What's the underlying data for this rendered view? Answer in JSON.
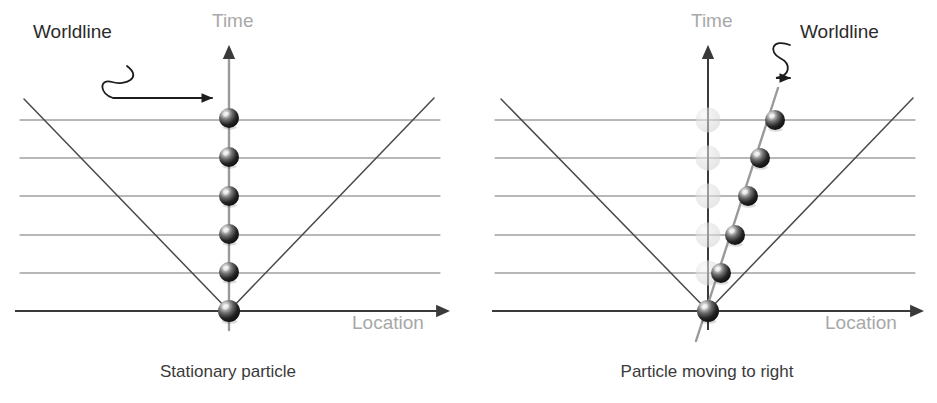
{
  "figure": {
    "width": 937,
    "height": 403,
    "background": "#ffffff"
  },
  "colors": {
    "axis": "#3a3a3a",
    "axis_label_gray": "#a8a8a8",
    "gridline": "#707070",
    "lightcone": "#4a4a4a",
    "worldline_gray": "#9a9a9a",
    "callout_text": "#2b2b2b",
    "caption_text": "#3a3a3a",
    "sphere_dark": "#1c1c1c",
    "sphere_mid": "#6b6b6b",
    "sphere_highlight": "#e8e8e8",
    "ghost_sphere": "#cfcfcf"
  },
  "panels": [
    {
      "id": "stationary",
      "caption": "Stationary particle",
      "caption_x": 228,
      "caption_y": 377,
      "origin": {
        "x": 229,
        "y": 311
      },
      "time_axis": {
        "label": "Time",
        "label_x": 212,
        "label_y": 27,
        "x": 229,
        "y_top": 47,
        "y_bottom": 330
      },
      "location_axis": {
        "label": "Location",
        "label_x": 352,
        "label_y": 329,
        "y": 311,
        "x_left": 15,
        "x_right": 448
      },
      "gridlines": {
        "x_left": 20,
        "x_right": 440,
        "y_values": [
          120,
          158,
          196,
          235,
          273
        ]
      },
      "lightcone": {
        "apex": {
          "x": 229,
          "y": 311
        },
        "left_end": {
          "x": 24,
          "y": 99
        },
        "right_end": {
          "x": 434,
          "y": 98
        }
      },
      "worldline": {
        "kind": "vertical",
        "x_start": 229,
        "y_start": 330,
        "x_end": 229,
        "y_end": 60,
        "color": "#9a9a9a"
      },
      "callout": {
        "label": "Worldline",
        "label_x": 33,
        "label_y": 38,
        "arrow_path": "M 127 66 C 143 78 125 86 112 82 C 99 78 99 94 113 98 L 212 98",
        "arrow_tip": {
          "x": 222,
          "y": 98
        }
      },
      "particles": [
        {
          "x": 229,
          "y": 118,
          "r": 10,
          "ghost": false
        },
        {
          "x": 229,
          "y": 157,
          "r": 10,
          "ghost": false
        },
        {
          "x": 229,
          "y": 196,
          "r": 10,
          "ghost": false
        },
        {
          "x": 229,
          "y": 234,
          "r": 10,
          "ghost": false
        },
        {
          "x": 229,
          "y": 272,
          "r": 10,
          "ghost": false
        },
        {
          "x": 229,
          "y": 311,
          "r": 11,
          "ghost": false
        }
      ]
    },
    {
      "id": "moving-right",
      "caption": "Particle moving to right",
      "caption_x": 707,
      "caption_y": 377,
      "origin": {
        "x": 708,
        "y": 311
      },
      "time_axis": {
        "label": "Time",
        "label_x": 691,
        "label_y": 27,
        "x": 708,
        "y_top": 47,
        "y_bottom": 330
      },
      "location_axis": {
        "label": "Location",
        "label_x": 825,
        "label_y": 329,
        "y": 311,
        "x_left": 492,
        "x_right": 922
      },
      "gridlines": {
        "x_left": 495,
        "x_right": 915,
        "y_values": [
          120,
          158,
          196,
          235,
          273
        ]
      },
      "lightcone": {
        "apex": {
          "x": 708,
          "y": 311
        },
        "left_end": {
          "x": 501,
          "y": 99
        },
        "right_end": {
          "x": 913,
          "y": 98
        }
      },
      "worldline": {
        "kind": "tilted",
        "x_start": 696,
        "y_start": 341,
        "x_end": 778,
        "y_end": 88,
        "color": "#9a9a9a"
      },
      "callout": {
        "label": "Worldline",
        "label_x": 800,
        "label_y": 38,
        "arrow_path": "M 790 45 C 772 38 768 52 780 58 C 792 64 790 76 776 78 L 790 78",
        "arrow_tip": {
          "x": 785,
          "y": 78
        }
      },
      "particles": [
        {
          "x": 775,
          "y": 120,
          "r": 10,
          "ghost": false
        },
        {
          "x": 760,
          "y": 158,
          "r": 10,
          "ghost": false
        },
        {
          "x": 748,
          "y": 196,
          "r": 10,
          "ghost": false
        },
        {
          "x": 735,
          "y": 235,
          "r": 10,
          "ghost": false
        },
        {
          "x": 721,
          "y": 273,
          "r": 10,
          "ghost": false
        },
        {
          "x": 708,
          "y": 311,
          "r": 11,
          "ghost": false
        }
      ],
      "ghost_particles": [
        {
          "x": 708,
          "y": 120,
          "r": 11,
          "ghost": true
        },
        {
          "x": 708,
          "y": 158,
          "r": 11,
          "ghost": true
        },
        {
          "x": 708,
          "y": 196,
          "r": 11,
          "ghost": true
        },
        {
          "x": 708,
          "y": 235,
          "r": 11,
          "ghost": true
        },
        {
          "x": 708,
          "y": 273,
          "r": 11,
          "ghost": true
        }
      ]
    }
  ]
}
